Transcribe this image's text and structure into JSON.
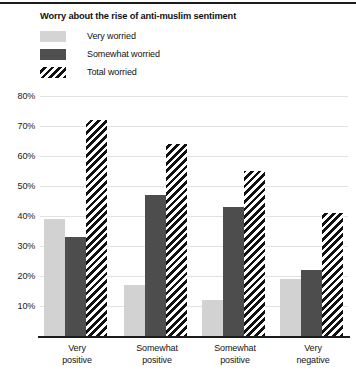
{
  "chart_data": {
    "type": "bar",
    "title": "Worry about the rise of anti-muslim sentiment",
    "xlabel": "",
    "ylabel": "",
    "ylim": [
      0,
      80
    ],
    "grid": true,
    "legend_position": "top-left",
    "categories": [
      "Very positive",
      "Somewhat positive",
      "Somewhat positive",
      "Very negative"
    ],
    "category_lines": [
      [
        "Very",
        "positive"
      ],
      [
        "Somewhat",
        "positive"
      ],
      [
        "Somewhat",
        "positive"
      ],
      [
        "Very",
        "negative"
      ]
    ],
    "ytick_labels": [
      "80%",
      "70%",
      "60%",
      "50%",
      "40%",
      "30%",
      "20%",
      "10%"
    ],
    "ytick_values": [
      80,
      70,
      60,
      50,
      40,
      30,
      20,
      10
    ],
    "series": [
      {
        "name": "Very worried",
        "style": "solid-light",
        "color": "#d2d2d2",
        "values": [
          39,
          17,
          12,
          19
        ]
      },
      {
        "name": "Somewhat worried",
        "style": "solid-dark",
        "color": "#4d4d4d",
        "values": [
          33,
          47,
          43,
          22
        ]
      },
      {
        "name": "Total worried",
        "style": "diagonal-hatch",
        "color": "#111111",
        "values": [
          72,
          64,
          55,
          41
        ]
      }
    ]
  },
  "legend": {
    "items": [
      {
        "label": "Very worried",
        "swatch": "light-gray-swatch"
      },
      {
        "label": "Somewhat worried",
        "swatch": "dark-gray-swatch"
      },
      {
        "label": "Total worried",
        "swatch": "hatched-swatch"
      }
    ]
  },
  "colors": {
    "very_worried": "#d2d2d2",
    "somewhat_worried": "#4d4d4d",
    "total_worried": "#111111",
    "gridline": "#e2e2e2",
    "axis": "#1c1c1c",
    "background": "#ffffff",
    "text": "#111111"
  }
}
